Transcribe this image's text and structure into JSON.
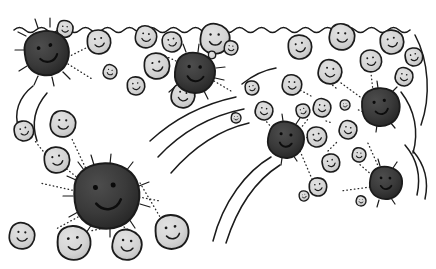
{
  "illustration": {
    "title": "Hand-drawn cartoon of dark and light smiling blob cells",
    "style": "ink line drawing with grayscale fills",
    "canvas": {
      "width": 436,
      "height": 269,
      "background": "#ffffff"
    },
    "palette": {
      "ink": "#1b1b1b",
      "dark_blob_fill": "#3a3a3a",
      "dark_blob_shade": "#2a2a2a",
      "light_blob_fill": "#d6d6d6",
      "light_blob_shade": "#bdbdbd",
      "background": "#ffffff",
      "dot_line": "#2a2a2a"
    },
    "elements": {
      "surface_line_label": "wavy-surface-line",
      "dark_blob_label": "dark-smiling-blob",
      "light_blob_label": "light-smiling-blob",
      "dot_connector_label": "dotted-connector",
      "radiating_ray_label": "radiating-ray",
      "motion_swoosh_label": "motion-swoosh-line"
    },
    "counts": {
      "dark_blobs": 5,
      "light_blobs": 33,
      "clusters": 3
    },
    "surface": {
      "name": "wavy-surface-line",
      "path": "M 16 30 C 40 24 64 27 88 29 C 112 31 136 26 160 29 C 184 32 208 26 232 29 C 256 32 280 26 304 29 C 328 32 352 26 376 29 C 396 31 412 27 424 24",
      "wave_path": "M 16 30 q 6 -5 12 0 t 12 0 t 12 0 t 12 0 t 12 0 t 12 0 t 12 0 t 12 0 t 12 0 t 12 0 t 12 0 t 12 0 t 12 0 t 12 0 t 12 0 t 12 0 t 12 0 t 12 0 t 12 0 t 12 0 t 12 0 t 12 0 t 12 0 t 12 0 t 12 0 t 12 0 t 12 0 t 12 0 t 12 0 t 12 0 t 12 0 t 12 0 t 12 0"
    },
    "dark_blobs": [
      {
        "name": "dark-blob-top-left",
        "cx": 47,
        "cy": 53,
        "rx": 23,
        "ry": 21,
        "rot": -12,
        "mouth": "wide"
      },
      {
        "name": "dark-blob-top-mid",
        "cx": 195,
        "cy": 73,
        "rx": 21,
        "ry": 19,
        "rot": 6,
        "mouth": "wide"
      },
      {
        "name": "dark-blob-center-big",
        "cx": 107,
        "cy": 196,
        "rx": 34,
        "ry": 30,
        "rot": -6,
        "mouth": "wide"
      },
      {
        "name": "dark-blob-right-mid",
        "cx": 286,
        "cy": 140,
        "rx": 19,
        "ry": 17,
        "rot": 10,
        "mouth": "narrow"
      },
      {
        "name": "dark-blob-right-up",
        "cx": 381,
        "cy": 107,
        "rx": 20,
        "ry": 17,
        "rot": -8,
        "mouth": "narrow"
      },
      {
        "name": "dark-blob-right-low",
        "cx": 386,
        "cy": 183,
        "rx": 17,
        "ry": 16,
        "rot": 4,
        "mouth": "narrow"
      }
    ],
    "light_blobs": [
      {
        "name": "light-blob-01",
        "cx": 65,
        "cy": 29,
        "r": 8
      },
      {
        "name": "light-blob-02",
        "cx": 99,
        "cy": 42,
        "r": 12
      },
      {
        "name": "light-blob-03",
        "cx": 146,
        "cy": 37,
        "r": 11
      },
      {
        "name": "light-blob-04",
        "cx": 172,
        "cy": 42,
        "r": 10
      },
      {
        "name": "light-blob-05",
        "cx": 215,
        "cy": 39,
        "r": 15
      },
      {
        "name": "light-blob-06",
        "cx": 157,
        "cy": 66,
        "r": 13
      },
      {
        "name": "light-blob-07",
        "cx": 183,
        "cy": 96,
        "r": 12
      },
      {
        "name": "light-blob-08",
        "cx": 136,
        "cy": 86,
        "r": 9
      },
      {
        "name": "light-blob-09",
        "cx": 110,
        "cy": 72,
        "r": 7
      },
      {
        "name": "light-blob-10",
        "cx": 24,
        "cy": 131,
        "r": 10
      },
      {
        "name": "light-blob-11",
        "cx": 63,
        "cy": 124,
        "r": 13
      },
      {
        "name": "light-blob-12",
        "cx": 57,
        "cy": 160,
        "r": 13
      },
      {
        "name": "light-blob-13",
        "cx": 22,
        "cy": 236,
        "r": 13
      },
      {
        "name": "light-blob-14",
        "cx": 74,
        "cy": 243,
        "r": 17
      },
      {
        "name": "light-blob-15",
        "cx": 127,
        "cy": 245,
        "r": 15
      },
      {
        "name": "light-blob-16",
        "cx": 172,
        "cy": 232,
        "r": 17
      },
      {
        "name": "light-blob-17",
        "cx": 231,
        "cy": 48,
        "r": 7
      },
      {
        "name": "light-blob-18",
        "cx": 300,
        "cy": 47,
        "r": 12
      },
      {
        "name": "light-blob-19",
        "cx": 342,
        "cy": 37,
        "r": 13
      },
      {
        "name": "light-blob-20",
        "cx": 392,
        "cy": 42,
        "r": 12
      },
      {
        "name": "light-blob-21",
        "cx": 330,
        "cy": 72,
        "r": 12
      },
      {
        "name": "light-blob-22",
        "cx": 371,
        "cy": 61,
        "r": 11
      },
      {
        "name": "light-blob-23",
        "cx": 404,
        "cy": 77,
        "r": 9
      },
      {
        "name": "light-blob-24",
        "cx": 414,
        "cy": 57,
        "r": 9
      },
      {
        "name": "light-blob-25",
        "cx": 292,
        "cy": 85,
        "r": 10
      },
      {
        "name": "light-blob-26",
        "cx": 303,
        "cy": 111,
        "r": 7
      },
      {
        "name": "light-blob-27",
        "cx": 322,
        "cy": 108,
        "r": 9
      },
      {
        "name": "light-blob-28",
        "cx": 345,
        "cy": 105,
        "r": 5
      },
      {
        "name": "light-blob-29",
        "cx": 317,
        "cy": 137,
        "r": 10
      },
      {
        "name": "light-blob-30",
        "cx": 348,
        "cy": 130,
        "r": 9
      },
      {
        "name": "light-blob-31",
        "cx": 331,
        "cy": 163,
        "r": 9
      },
      {
        "name": "light-blob-32",
        "cx": 359,
        "cy": 155,
        "r": 7
      },
      {
        "name": "light-blob-33",
        "cx": 318,
        "cy": 187,
        "r": 9
      },
      {
        "name": "light-blob-34",
        "cx": 264,
        "cy": 111,
        "r": 8
      },
      {
        "name": "light-blob-35",
        "cx": 252,
        "cy": 88,
        "r": 7
      }
    ],
    "connectors": [
      {
        "from": [
          68,
          57
        ],
        "to": [
          88,
          46
        ]
      },
      {
        "from": [
          68,
          62
        ],
        "to": [
          92,
          78
        ]
      },
      {
        "from": [
          63,
          40
        ],
        "to": [
          63,
          34
        ]
      },
      {
        "from": [
          176,
          60
        ],
        "to": [
          164,
          55
        ]
      },
      {
        "from": [
          180,
          88
        ],
        "to": [
          186,
          85
        ]
      },
      {
        "from": [
          214,
          80
        ],
        "to": [
          232,
          90
        ]
      },
      {
        "from": [
          140,
          182
        ],
        "to": [
          163,
          222
        ]
      },
      {
        "from": [
          138,
          196
        ],
        "to": [
          160,
          200
        ]
      },
      {
        "from": [
          124,
          226
        ],
        "to": [
          133,
          232
        ]
      },
      {
        "from": [
          100,
          228
        ],
        "to": [
          90,
          230
        ]
      },
      {
        "from": [
          78,
          216
        ],
        "to": [
          55,
          228
        ]
      },
      {
        "from": [
          76,
          190
        ],
        "to": [
          40,
          182
        ]
      },
      {
        "from": [
          78,
          178
        ],
        "to": [
          46,
          152
        ]
      },
      {
        "from": [
          86,
          170
        ],
        "to": [
          70,
          136
        ]
      },
      {
        "from": [
          42,
          150
        ],
        "to": [
          34,
          140
        ]
      },
      {
        "from": [
          300,
          128
        ],
        "to": [
          308,
          118
        ]
      },
      {
        "from": [
          302,
          136
        ],
        "to": [
          309,
          137
        ]
      },
      {
        "from": [
          300,
          150
        ],
        "to": [
          312,
          178
        ]
      },
      {
        "from": [
          272,
          127
        ],
        "to": [
          265,
          119
        ]
      },
      {
        "from": [
          366,
          112
        ],
        "to": [
          356,
          108
        ]
      },
      {
        "from": [
          362,
          98
        ],
        "to": [
          340,
          82
        ]
      },
      {
        "from": [
          372,
          90
        ],
        "to": [
          370,
          72
        ]
      },
      {
        "from": [
          372,
          174
        ],
        "to": [
          358,
          162
        ]
      },
      {
        "from": [
          369,
          186
        ],
        "to": [
          340,
          190
        ]
      },
      {
        "from": [
          378,
          167
        ],
        "to": [
          366,
          140
        ]
      },
      {
        "from": [
          328,
          150
        ],
        "to": [
          338,
          140
        ]
      },
      {
        "from": [
          326,
          120
        ],
        "to": [
          332,
          122
        ]
      }
    ],
    "swooshes": [
      {
        "name": "swoosh-left-1",
        "path": "M 32 86  C 18 96 12 112 18 128"
      },
      {
        "name": "swoosh-left-2",
        "path": "M 46 92  C 34 106 30 122 36 140"
      },
      {
        "name": "swoosh-mid-1",
        "path": "M 150 140 C 176 116 208 102 236 96"
      },
      {
        "name": "swoosh-mid-2",
        "path": "M 158 156 C 184 128 214 114 244 108"
      },
      {
        "name": "swoosh-mid-3",
        "path": "M 170 172 C 196 142 222 128 248 122"
      },
      {
        "name": "swoosh-low-1",
        "path": "M 214 240 C 224 200 248 170 272 156"
      },
      {
        "name": "swoosh-low-2",
        "path": "M 226 242 C 238 204 258 178 280 164"
      },
      {
        "name": "swoosh-right-1",
        "path": "M 414 36  C 428 62 430 98 420 126"
      },
      {
        "name": "swoosh-right-2",
        "path": "M 400 92  C 414 110 418 132 412 152"
      },
      {
        "name": "swoosh-right-3",
        "path": "M 404 144 C 416 158 420 176 416 194"
      },
      {
        "name": "swoosh-right-4",
        "path": "M 412 150 C 424 164 428 180 424 198"
      }
    ]
  }
}
